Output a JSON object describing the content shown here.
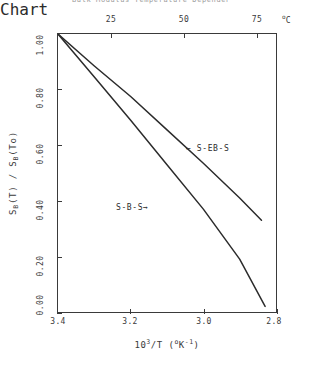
{
  "title": {
    "text": "Bulk Modulus  Temperature Dependence",
    "clipped": true
  },
  "axes": {
    "top": {
      "label": "temperature",
      "unit": "C",
      "unit_prefix": "o",
      "ticks": [
        "25",
        "50",
        "75"
      ],
      "tick_values": [
        25,
        50,
        75
      ]
    },
    "bottom": {
      "title_base": "10",
      "title_exp": "3",
      "title_rest": "/T  (",
      "title_unit_deg": "o",
      "title_unit_k": "K",
      "title_unit_exp": "-1",
      "title_close": ")",
      "ticks": [
        "3.4",
        "3.2",
        "3.0",
        "2.8"
      ],
      "tick_values": [
        3.4,
        3.2,
        3.0,
        2.8
      ]
    },
    "left": {
      "title_s1": "S",
      "title_sub1": "B",
      "title_mid": "(T)  /  ",
      "title_s2": "S",
      "title_sub2": "B",
      "title_end": "(To)",
      "ticks": [
        "1.00",
        "0.80",
        "0.60",
        "0.40",
        "0.20",
        "0.00"
      ],
      "tick_values": [
        1.0,
        0.8,
        0.6,
        0.4,
        0.2,
        0.0
      ]
    }
  },
  "annotations": [
    {
      "name": "s-eb-s",
      "arrow": "←",
      "text": "S-EB-S",
      "arrow_side": "left"
    },
    {
      "name": "s-b-s",
      "arrow": "→",
      "text": "S-B-S",
      "arrow_side": "right"
    }
  ],
  "colors": {
    "curve": "#2b2b2b",
    "axis": "#3a3a3a",
    "background": "#ffffff",
    "title_faded": "#9a9a9a"
  },
  "chart_data": {
    "type": "line",
    "title": "Bulk Modulus Temperature Dependence",
    "xlabel": "10^3/T  (oK^-1)",
    "ylabel": "S_B(T) / S_B(To)",
    "xlim": [
      3.4,
      2.8
    ],
    "ylim": [
      0.0,
      1.0
    ],
    "x_axis_reversed": true,
    "grid": false,
    "legend": "inline-annotations",
    "secondary_xaxis": {
      "label": "oC",
      "ticks": [
        25,
        50,
        75
      ],
      "note": "temperature in degrees Celsius, increases left to right"
    },
    "series": [
      {
        "name": "S-EB-S",
        "x": [
          3.4,
          3.3,
          3.2,
          3.1,
          3.0,
          2.9,
          2.84
        ],
        "values": [
          1.0,
          0.885,
          0.775,
          0.655,
          0.535,
          0.41,
          0.33
        ]
      },
      {
        "name": "S-B-S",
        "x": [
          3.4,
          3.3,
          3.2,
          3.1,
          3.0,
          2.9,
          2.83
        ],
        "values": [
          1.0,
          0.845,
          0.69,
          0.53,
          0.37,
          0.19,
          0.02
        ]
      }
    ]
  }
}
